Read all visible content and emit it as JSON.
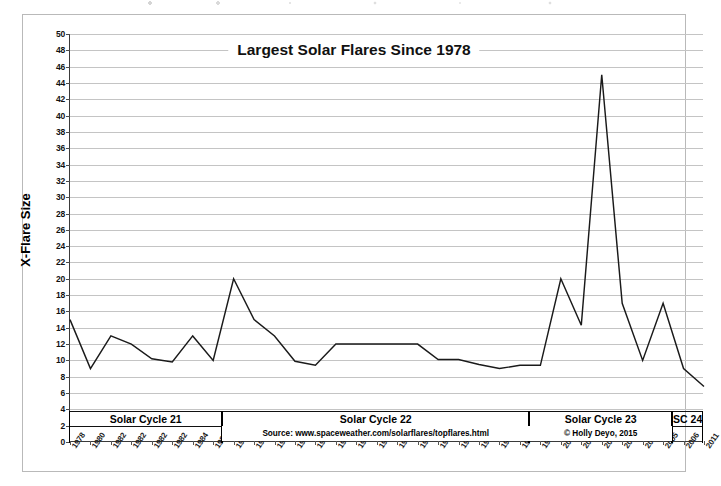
{
  "chart_data": {
    "type": "line",
    "title": "Largest Solar Flares Since 1978",
    "xlabel": "",
    "ylabel": "X-Flare Size",
    "ylim": [
      0,
      50
    ],
    "ytick_step": 2,
    "grid": true,
    "legend": "none",
    "categories": [
      "1978",
      "1980",
      "1982",
      "1982",
      "1982",
      "1982",
      "1984",
      "1984",
      "1989",
      "1989",
      "1989",
      "1989",
      "1990",
      "1991",
      "1991",
      "1991",
      "1991",
      "1991",
      "1991",
      "1991",
      "1991",
      "1991",
      "1992",
      "1997",
      "2001",
      "2001",
      "2003",
      "2003",
      "2003",
      "2005",
      "2006",
      "2011"
    ],
    "values": [
      15,
      9,
      13,
      12,
      10.2,
      9.8,
      13,
      10,
      20,
      15,
      13,
      9.9,
      9.4,
      12,
      12,
      12,
      12,
      12,
      10.1,
      10.1,
      9.5,
      9,
      9.4,
      9.4,
      20,
      14.3,
      45,
      17,
      10,
      17,
      9,
      6.8
    ],
    "yticks": [
      0,
      2,
      4,
      6,
      8,
      10,
      12,
      14,
      16,
      18,
      20,
      22,
      24,
      26,
      28,
      30,
      32,
      34,
      36,
      38,
      40,
      42,
      44,
      46,
      48,
      50
    ],
    "annotations": [
      {
        "name": "source",
        "text": "Source: www.spaceweather.com/solarflares/topflares.html"
      },
      {
        "name": "copyright",
        "text": "© Holly Deyo, 2015"
      }
    ],
    "cycle_bands": [
      {
        "label": "Solar Cycle 21",
        "start_index": 0,
        "end_index": 7
      },
      {
        "label": "Solar Cycle 22",
        "start_index": 8,
        "end_index": 22
      },
      {
        "label": "Solar Cycle 23",
        "start_index": 23,
        "end_index": 29
      },
      {
        "label": "SC 24",
        "start_index": 30,
        "end_index": 31
      }
    ],
    "colors": {
      "line": "#1a1a1a",
      "grid": "#c4c4c4",
      "axis": "#3a3a3a",
      "text": "#111111",
      "background": "#ffffff"
    }
  }
}
